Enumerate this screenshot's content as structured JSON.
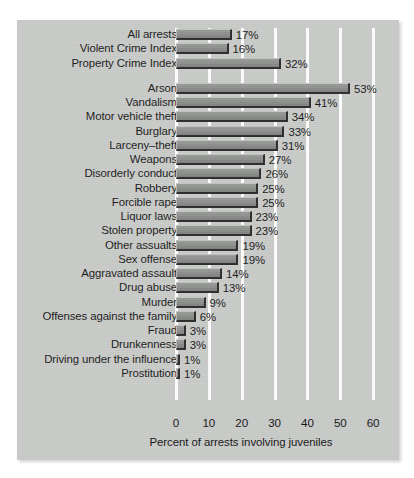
{
  "chart_data": {
    "type": "bar",
    "orientation": "horizontal",
    "title": "",
    "subtitle": "",
    "xlabel": "Percent of arrests involving juveniles",
    "ylabel": "",
    "xlim": [
      0,
      63
    ],
    "xticks": [
      0,
      10,
      20,
      30,
      40,
      50,
      60
    ],
    "xtick_labels": [
      "0",
      "10",
      "20",
      "30",
      "40",
      "50",
      "60"
    ],
    "grid": true,
    "grid_axis": "x",
    "grid_color": "#fdfdfd",
    "legend": null,
    "bar_color": "#8d8f8d",
    "background_color": "#c9cbc9",
    "value_suffix": "%",
    "groups": [
      {
        "name": "summary",
        "categories": [
          "All arrests",
          "Violent Crime Index",
          "Property Crime Index"
        ],
        "values": [
          17,
          16,
          32
        ],
        "value_labels": [
          "17%",
          "16%",
          "32%"
        ]
      },
      {
        "name": "offenses",
        "categories": [
          "Arson",
          "Vandalism",
          "Motor vehicle theft",
          "Burglary",
          "Larceny–theft",
          "Weapons",
          "Disorderly conduct",
          "Robbery",
          "Forcible rape",
          "Liquor laws",
          "Stolen property",
          "Other assualts",
          "Sex offense",
          "Aggravated assault",
          "Drug abuse",
          "Murder",
          "Offenses against the family",
          "Fraud",
          "Drunkenness",
          "Driving under the influence",
          "Prostitution"
        ],
        "values": [
          53,
          41,
          34,
          33,
          31,
          27,
          26,
          25,
          25,
          23,
          23,
          19,
          19,
          14,
          13,
          9,
          6,
          3,
          3,
          1,
          1
        ],
        "value_labels": [
          "53%",
          "41%",
          "34%",
          "33%",
          "31%",
          "27%",
          "26%",
          "25%",
          "25%",
          "23%",
          "23%",
          "19%",
          "19%",
          "14%",
          "13%",
          "9%",
          "6%",
          "3%",
          "3%",
          "1%",
          "1%"
        ]
      }
    ],
    "categories": [
      "All arrests",
      "Violent Crime Index",
      "Property Crime Index",
      "Arson",
      "Vandalism",
      "Motor vehicle theft",
      "Burglary",
      "Larceny–theft",
      "Weapons",
      "Disorderly conduct",
      "Robbery",
      "Forcible rape",
      "Liquor laws",
      "Stolen property",
      "Other assualts",
      "Sex offense",
      "Aggravated assault",
      "Drug abuse",
      "Murder",
      "Offenses against the family",
      "Fraud",
      "Drunkenness",
      "Driving under the influence",
      "Prostitution"
    ],
    "values": [
      17,
      16,
      32,
      53,
      41,
      34,
      33,
      31,
      27,
      26,
      25,
      25,
      23,
      23,
      19,
      19,
      14,
      13,
      9,
      6,
      3,
      3,
      1,
      1
    ]
  }
}
